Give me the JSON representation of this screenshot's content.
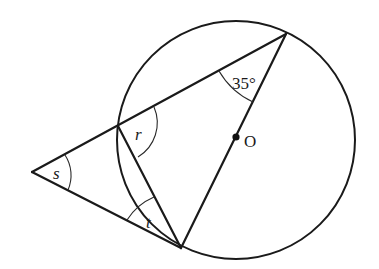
{
  "diagram": {
    "title": "",
    "circle": {
      "cx": 236,
      "cy": 139,
      "r": 119,
      "center_label": "O"
    },
    "points": {
      "A_external": {
        "x": 32,
        "y": 172
      },
      "B_secant_entry": {
        "x": 118,
        "y": 126
      },
      "C_top": {
        "x": 286,
        "y": 34
      },
      "D_tangent_point": {
        "x": 181,
        "y": 248
      },
      "O_center": {
        "x": 236,
        "y": 137
      }
    },
    "angles": {
      "given": {
        "label": "35°",
        "value_deg": 35,
        "vertex": "C_top"
      },
      "r": {
        "label": "r",
        "vertex": "B_secant_entry"
      },
      "s": {
        "label": "s",
        "vertex": "A_external"
      },
      "t": {
        "label": "t",
        "vertex": "D_tangent_point"
      }
    },
    "segments": [
      "A_external-C_top",
      "A_external-D_tangent_point",
      "B_secant_entry-D_tangent_point",
      "C_top-D_tangent_point"
    ]
  }
}
